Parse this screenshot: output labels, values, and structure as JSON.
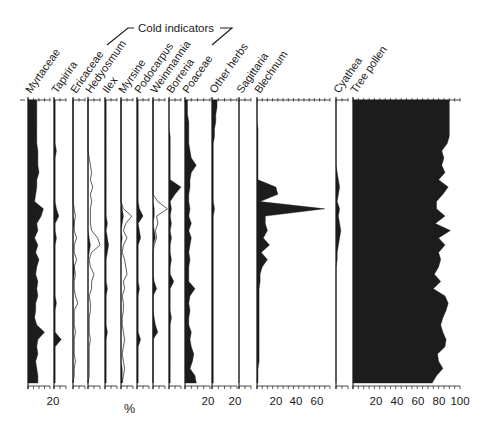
{
  "chart_data": {
    "type": "area",
    "subtype": "stratigraphic pollen diagram",
    "title": "",
    "group_annotation": "Cold indicators",
    "group_members": [
      "Ericaceae",
      "Hedyosmum",
      "Ilex",
      "Myrsine",
      "Podocarpus",
      "Weinmannia"
    ],
    "xlabel": "%",
    "ylabel": "",
    "y_axis": "depth/time (top to bottom, unlabeled)",
    "n_samples": 40,
    "taxa": [
      {
        "name": "Myrtaceae",
        "x0": 28,
        "xmax_px": 50,
        "scale_max": 20,
        "tick_labels": [
          "20"
        ],
        "tick_label_x": 53,
        "values": [
          8,
          8,
          8,
          8,
          8,
          8,
          8,
          9,
          9,
          9,
          10,
          8,
          8,
          7,
          6,
          14,
          12,
          8,
          9,
          6,
          9,
          7,
          10,
          8,
          7,
          9,
          8,
          9,
          7,
          7,
          6,
          8,
          15,
          9,
          8,
          9,
          7,
          8,
          9,
          9
        ]
      },
      {
        "name": "Tapirira",
        "x0": 54,
        "xmax_px": 66,
        "scale_max": 10,
        "tick_labels": [],
        "values": [
          1,
          1,
          1,
          1,
          1,
          1,
          1,
          2,
          1,
          1,
          1,
          1,
          1,
          1,
          1,
          2,
          4,
          1,
          1,
          2,
          1,
          1,
          1,
          1,
          1,
          1,
          1,
          1,
          2,
          1,
          1,
          1,
          1,
          6,
          1,
          1,
          1,
          1,
          1,
          1
        ]
      },
      {
        "name": "Ericaceae",
        "x0": 73,
        "xmax_px": 85,
        "scale_max": 10,
        "tick_labels": [],
        "values": [
          0,
          0,
          0,
          0,
          0,
          0,
          0,
          0,
          0,
          0,
          0,
          0,
          0,
          0,
          0,
          0,
          0,
          1,
          0,
          0,
          0,
          0,
          0,
          1,
          1,
          0,
          0,
          0,
          0,
          0,
          0,
          0,
          0,
          0,
          0,
          0,
          0,
          0,
          0,
          0
        ],
        "exaggeration": [
          0,
          0,
          0,
          0,
          0,
          0,
          0,
          0,
          0,
          0,
          0,
          0,
          0,
          0,
          0,
          1,
          2,
          1,
          1,
          3,
          1,
          1,
          3,
          1,
          2,
          1,
          1,
          2,
          4,
          1,
          1,
          1,
          2,
          1,
          1,
          1,
          2,
          1,
          1,
          0
        ]
      },
      {
        "name": "Hedyosmum",
        "x0": 88,
        "xmax_px": 100,
        "scale_max": 10,
        "tick_labels": [],
        "values": [
          0,
          0,
          0,
          0,
          0,
          0,
          0,
          0,
          0,
          0,
          0,
          0,
          0,
          0,
          0,
          0,
          0,
          0,
          0,
          1,
          2,
          1,
          0,
          0,
          0,
          0,
          0,
          0,
          0,
          0,
          0,
          0,
          0,
          0,
          0,
          0,
          0,
          0,
          0,
          0
        ],
        "exaggeration": [
          0,
          0,
          0,
          0,
          0,
          0,
          0,
          0,
          1,
          2,
          3,
          2,
          4,
          2,
          3,
          2,
          2,
          2,
          3,
          8,
          10,
          3,
          1,
          2,
          5,
          3,
          3,
          1,
          2,
          2,
          1,
          1,
          1,
          2,
          1,
          1,
          1,
          1,
          1,
          0
        ]
      },
      {
        "name": "Ilex",
        "x0": 105,
        "xmax_px": 117,
        "scale_max": 10,
        "tick_labels": [],
        "values": [
          1,
          1,
          1,
          1,
          1,
          1,
          1,
          1,
          1,
          1,
          1,
          1,
          1,
          1,
          1,
          1,
          1,
          2,
          1,
          2,
          3,
          2,
          1,
          1,
          1,
          1,
          2,
          1,
          1,
          1,
          1,
          1,
          2,
          1,
          1,
          1,
          1,
          1,
          1,
          1
        ]
      },
      {
        "name": "Myrsine",
        "x0": 121,
        "xmax_px": 133,
        "scale_max": 10,
        "tick_labels": [],
        "values": [
          0,
          0,
          0,
          0,
          0,
          0,
          0,
          0,
          0,
          0,
          0,
          0,
          0,
          0,
          0,
          1,
          2,
          1,
          0,
          1,
          0,
          0,
          0,
          0,
          0,
          0,
          0,
          0,
          0,
          0,
          0,
          0,
          0,
          0,
          0,
          0,
          0,
          1,
          1,
          1
        ],
        "exaggeration": [
          0,
          0,
          0,
          0,
          0,
          0,
          0,
          0,
          0,
          0,
          0,
          0,
          0,
          0,
          0,
          2,
          9,
          4,
          2,
          5,
          2,
          1,
          3,
          4,
          5,
          2,
          3,
          1,
          2,
          2,
          1,
          1,
          2,
          3,
          2,
          1,
          2,
          3,
          2,
          1
        ]
      },
      {
        "name": "Podocarpus",
        "x0": 137,
        "xmax_px": 149,
        "scale_max": 10,
        "tick_labels": [],
        "values": [
          1,
          1,
          1,
          1,
          1,
          1,
          1,
          1,
          1,
          1,
          1,
          1,
          1,
          1,
          1,
          2,
          5,
          1,
          2,
          3,
          1,
          1,
          1,
          1,
          1,
          1,
          2,
          1,
          1,
          1,
          1,
          1,
          1,
          3,
          1,
          1,
          1,
          1,
          1,
          1
        ]
      },
      {
        "name": "Weinmannia",
        "x0": 153,
        "xmax_px": 165,
        "scale_max": 10,
        "tick_labels": [],
        "values": [
          0,
          0,
          0,
          0,
          0,
          0,
          0,
          0,
          0,
          0,
          0,
          0,
          0,
          0,
          0,
          1,
          1,
          0,
          1,
          2,
          0,
          0,
          0,
          0,
          0,
          1,
          3,
          0,
          0,
          0,
          1,
          2,
          4,
          0,
          0,
          0,
          0,
          0,
          0,
          0
        ],
        "exaggeration": [
          0,
          0,
          0,
          0,
          0,
          0,
          0,
          0,
          0,
          0,
          0,
          0,
          0,
          0,
          4,
          12,
          3,
          4,
          2,
          3,
          1,
          0,
          0,
          0,
          0,
          0,
          0,
          0,
          0,
          0,
          0,
          0,
          0,
          0,
          0,
          0,
          0,
          0,
          0,
          0
        ]
      },
      {
        "name": "Borreria",
        "x0": 169,
        "xmax_px": 181,
        "scale_max": 10,
        "tick_labels": [],
        "values": [
          0,
          0,
          0,
          0,
          0,
          1,
          1,
          1,
          1,
          1,
          1,
          1,
          10,
          5,
          1,
          2,
          1,
          2,
          1,
          2,
          1,
          1,
          2,
          1,
          1,
          4,
          1,
          1,
          1,
          1,
          2,
          1,
          1,
          1,
          1,
          1,
          1,
          1,
          1,
          1
        ]
      },
      {
        "name": "Poaceae",
        "x0": 185,
        "xmax_px": 210,
        "scale_max": 20,
        "tick_labels": [
          "20"
        ],
        "tick_label_x": 208,
        "values": [
          2,
          2,
          2,
          3,
          3,
          3,
          3,
          4,
          5,
          9,
          5,
          4,
          4,
          3,
          3,
          4,
          3,
          5,
          3,
          5,
          4,
          3,
          4,
          3,
          3,
          3,
          8,
          4,
          3,
          4,
          3,
          3,
          5,
          4,
          5,
          7,
          6,
          4,
          8,
          9
        ]
      },
      {
        "name": "Other herbs",
        "x0": 212,
        "xmax_px": 237,
        "scale_max": 20,
        "tick_labels": [
          "20"
        ],
        "tick_label_x": 235,
        "values": [
          4,
          4,
          3,
          3,
          2,
          2,
          1,
          1,
          1,
          1,
          1,
          1,
          1,
          1,
          1,
          2,
          1,
          1,
          1,
          1,
          1,
          1,
          1,
          1,
          1,
          1,
          1,
          1,
          1,
          1,
          1,
          1,
          1,
          1,
          1,
          1,
          1,
          1,
          1,
          1
        ]
      },
      {
        "name": "Sagittaria",
        "x0": 239,
        "xmax_px": 251,
        "scale_max": 10,
        "tick_labels": [],
        "values": [
          0,
          0,
          0,
          0,
          0,
          0,
          0,
          0,
          0,
          0,
          0,
          0,
          0,
          0,
          0,
          0,
          0,
          0,
          0,
          0,
          0,
          0,
          0,
          0,
          0,
          0,
          0,
          0,
          0,
          0,
          0,
          0,
          0,
          0,
          0,
          0,
          0,
          0,
          0,
          0
        ]
      },
      {
        "name": "Blechnum",
        "x0": 257,
        "xmax_px": 330,
        "scale_max": 70,
        "tick_labels": [
          "20",
          "40",
          "60"
        ],
        "tick_label_x": [
          276,
          296,
          317
        ],
        "values": [
          0,
          0,
          0,
          0,
          1,
          1,
          1,
          1,
          1,
          1,
          1,
          1,
          18,
          20,
          3,
          65,
          8,
          8,
          10,
          6,
          12,
          4,
          10,
          5,
          3,
          3,
          2,
          2,
          2,
          2,
          2,
          2,
          2,
          2,
          2,
          2,
          2,
          1,
          1,
          1
        ]
      },
      {
        "name": "Cyathea",
        "x0": 336,
        "xmax_px": 348,
        "scale_max": 10,
        "tick_labels": [],
        "values": [
          0,
          0,
          0,
          0,
          0,
          0,
          0,
          0,
          0,
          0,
          1,
          2,
          3,
          2,
          1,
          3,
          2,
          3,
          4,
          3,
          2,
          1,
          1,
          0,
          0,
          0,
          0,
          0,
          0,
          0,
          0,
          0,
          0,
          0,
          0,
          0,
          0,
          0,
          0,
          0
        ]
      },
      {
        "name": "Tree pollen",
        "x0": 353,
        "xmax_px": 460,
        "scale_max": 100,
        "tick_labels": [
          "20",
          "40",
          "60",
          "80",
          "100"
        ],
        "tick_label_x": [
          376,
          397,
          418,
          439,
          460
        ],
        "values": [
          90,
          90,
          90,
          90,
          90,
          90,
          88,
          83,
          85,
          83,
          86,
          80,
          89,
          84,
          78,
          78,
          86,
          77,
          91,
          80,
          86,
          80,
          82,
          80,
          76,
          82,
          75,
          86,
          89,
          87,
          84,
          82,
          84,
          87,
          86,
          79,
          80,
          84,
          78,
          74
        ]
      }
    ],
    "legend": "filled silhouettes = %; hollow outlines = exaggeration curves (cold indicator taxa)",
    "grid": false
  },
  "labels": {
    "group": "Cold indicators",
    "unit": "%"
  }
}
